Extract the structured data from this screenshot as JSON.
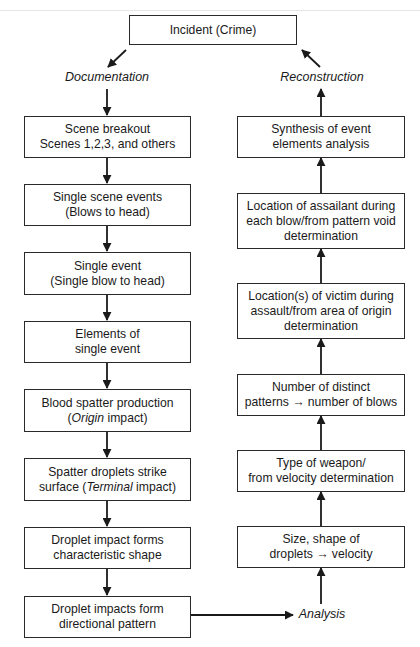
{
  "diagram": {
    "top": {
      "label": "Incident (Crime)"
    },
    "labels": {
      "documentation": "Documentation",
      "reconstruction": "Reconstruction",
      "analysis": "Analysis"
    },
    "left_column": [
      {
        "lines": [
          "Scene breakout",
          "Scenes 1,2,3, and others"
        ]
      },
      {
        "lines": [
          "Single scene events",
          "(Blows to head)"
        ]
      },
      {
        "lines": [
          "Single event",
          "(Single blow to head)"
        ]
      },
      {
        "lines": [
          "Elements of",
          "single event"
        ]
      },
      {
        "lines": [
          "Blood spatter production",
          "(Origin impact)"
        ],
        "italic_word": "Origin"
      },
      {
        "lines": [
          "Spatter droplets strike",
          "surface (Terminal impact)"
        ],
        "italic_word": "Terminal"
      },
      {
        "lines": [
          "Droplet impact forms",
          "characteristic shape"
        ]
      },
      {
        "lines": [
          "Droplet impacts form",
          "directional pattern"
        ]
      }
    ],
    "right_column": [
      {
        "lines": [
          "Synthesis of event",
          "elements analysis"
        ]
      },
      {
        "lines": [
          "Location of assailant during",
          "each blow/from pattern void",
          "determination"
        ]
      },
      {
        "lines": [
          "Location(s) of victim during",
          "assault/from area of origin",
          "determination"
        ]
      },
      {
        "lines": [
          "Number of distinct",
          "patterns → number of blows"
        ]
      },
      {
        "lines": [
          "Type of weapon/",
          "from velocity determination"
        ]
      },
      {
        "lines": [
          "Size, shape of",
          "droplets → velocity"
        ]
      }
    ],
    "colors": {
      "line": "#1a1a1a",
      "border": "#2a2a2a",
      "background": "#ffffff"
    }
  }
}
